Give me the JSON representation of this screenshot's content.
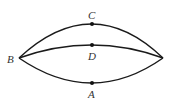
{
  "diagram": {
    "vertices": [
      {
        "id": "B",
        "label": "B"
      },
      {
        "id": "R",
        "label": ""
      }
    ],
    "curves": [
      {
        "id": "upper",
        "from": "B",
        "to": "R",
        "through": "C"
      },
      {
        "id": "middle",
        "from": "B",
        "to": "R",
        "through": "D"
      },
      {
        "id": "lower",
        "from": "B",
        "to": "R",
        "through": "A"
      }
    ],
    "points": [
      {
        "id": "C",
        "label": "C",
        "on": "upper"
      },
      {
        "id": "D",
        "label": "D",
        "on": "middle"
      },
      {
        "id": "A",
        "label": "A",
        "on": "lower"
      }
    ],
    "colors": {
      "stroke": "#1a1a1a",
      "label": "#333333"
    }
  }
}
